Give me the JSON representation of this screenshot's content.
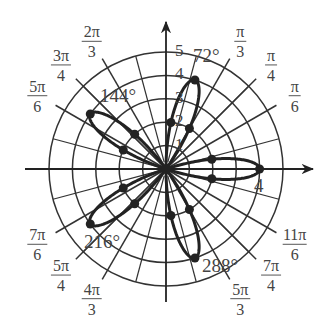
{
  "chart_data": {
    "type": "line",
    "subtype": "polar",
    "equation": "r = 4cos(5θ)",
    "title": "",
    "xlabel": "",
    "ylabel": "",
    "r_ticks": [
      1,
      2,
      3,
      4,
      5
    ],
    "r_tick_labels": [
      "1",
      "2",
      "3",
      "4",
      "5"
    ],
    "r_max": 5,
    "grid": true,
    "grid_angles_deg": [
      0,
      30,
      45,
      60,
      90,
      120,
      135,
      150,
      180,
      210,
      225,
      240,
      270,
      300,
      315,
      330
    ],
    "angle_labels": [
      {
        "deg": 30,
        "num": "π",
        "den": "6"
      },
      {
        "deg": 45,
        "num": "π",
        "den": "4"
      },
      {
        "deg": 60,
        "num": "π",
        "den": "3"
      },
      {
        "deg": 120,
        "num": "2π",
        "den": "3"
      },
      {
        "deg": 135,
        "num": "3π",
        "den": "4"
      },
      {
        "deg": 150,
        "num": "5π",
        "den": "6"
      },
      {
        "deg": 210,
        "num": "7π",
        "den": "6"
      },
      {
        "deg": 225,
        "num": "5π",
        "den": "4"
      },
      {
        "deg": 240,
        "num": "4π",
        "den": "3"
      },
      {
        "deg": 300,
        "num": "5π",
        "den": "3"
      },
      {
        "deg": 315,
        "num": "7π",
        "den": "4"
      },
      {
        "deg": 330,
        "num": "11π",
        "den": "6"
      }
    ],
    "petal_angles_deg": [
      0,
      72,
      144,
      216,
      288
    ],
    "petal_length": 4,
    "annotations": [
      {
        "text": "72°",
        "deg": 72
      },
      {
        "text": "144°",
        "deg": 144
      },
      {
        "text": "216°",
        "deg": 216
      },
      {
        "text": "288°",
        "deg": 288
      },
      {
        "text": "4",
        "deg": 0
      }
    ],
    "points": [
      {
        "theta_deg": 0,
        "r": 4
      },
      {
        "theta_deg": 12,
        "r": 2
      },
      {
        "theta_deg": -12,
        "r": 2
      },
      {
        "theta_deg": 72,
        "r": 4
      },
      {
        "theta_deg": 84,
        "r": 2
      },
      {
        "theta_deg": 60,
        "r": 2
      },
      {
        "theta_deg": 144,
        "r": 4
      },
      {
        "theta_deg": 156,
        "r": 2
      },
      {
        "theta_deg": 132,
        "r": 2
      },
      {
        "theta_deg": 216,
        "r": 4
      },
      {
        "theta_deg": 228,
        "r": 2
      },
      {
        "theta_deg": 204,
        "r": 2
      },
      {
        "theta_deg": 288,
        "r": 4
      },
      {
        "theta_deg": 300,
        "r": 2
      },
      {
        "theta_deg": 276,
        "r": 2
      }
    ]
  },
  "colors": {
    "curve": "#222222",
    "grid": "#333333",
    "text": "#444444"
  }
}
